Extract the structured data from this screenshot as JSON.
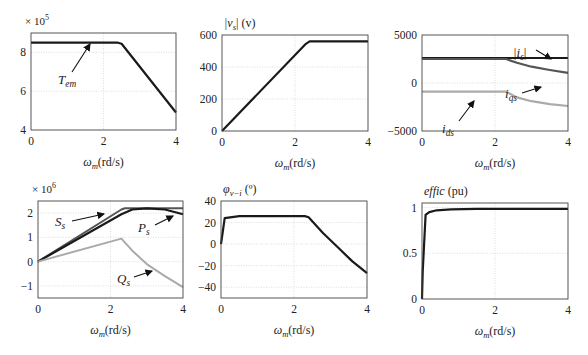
{
  "figure": {
    "xlabel_main": "ω",
    "xlabel_sub": "m",
    "xlabel_unit": "(rd/s)"
  },
  "chart_data": [
    {
      "id": "tem",
      "type": "line",
      "title": "",
      "multiplier": "× 10",
      "multiplier_exp": "5",
      "ylabel": "",
      "xlabel": "ωm(rd/s)",
      "frame": {
        "x0": 31,
        "x1": 176,
        "y0": 33,
        "y1": 130
      },
      "xlim": [
        0,
        4
      ],
      "ylim": [
        4,
        9
      ],
      "xticks": [
        0,
        2,
        4
      ],
      "yticks": [
        4,
        6,
        8
      ],
      "ytick_labels": [
        "4",
        "6",
        "8"
      ],
      "grid": true,
      "series": [
        {
          "name": "Tem",
          "color": "#1a1a1a",
          "width": 2.2,
          "x": [
            0,
            2.4,
            2.5,
            4
          ],
          "y": [
            8.5,
            8.5,
            8.45,
            4.9
          ]
        }
      ],
      "annotations": [
        {
          "text": "T",
          "sub": "em",
          "tx": 58,
          "ty": 84,
          "ax": 72,
          "ay": 72,
          "hx": 90,
          "hy": 44
        }
      ]
    },
    {
      "id": "vs",
      "type": "line",
      "title": "|vs| (v)",
      "multiplier": "",
      "multiplier_exp": "",
      "ylabel_main": "|v",
      "ylabel_sub": "s",
      "ylabel_rest": "| (v)",
      "xlabel": "ωm(rd/s)",
      "frame": {
        "x0": 222,
        "x1": 368,
        "y0": 35,
        "y1": 131
      },
      "xlim": [
        0,
        4
      ],
      "ylim": [
        0,
        600
      ],
      "xticks": [
        0,
        2,
        4
      ],
      "yticks": [
        0,
        200,
        400,
        600
      ],
      "ytick_labels": [
        "0",
        "200",
        "400",
        "600"
      ],
      "grid": true,
      "series": [
        {
          "name": "|vs|",
          "color": "#1a1a1a",
          "width": 2.2,
          "x": [
            0,
            2.3,
            2.4,
            4
          ],
          "y": [
            0,
            545,
            560,
            560
          ]
        }
      ],
      "annotations": []
    },
    {
      "id": "currents",
      "type": "line",
      "title": "",
      "multiplier": "",
      "multiplier_exp": "",
      "xlabel": "ωm(rd/s)",
      "frame": {
        "x0": 422,
        "x1": 568,
        "y0": 35,
        "y1": 131
      },
      "xlim": [
        0,
        4
      ],
      "ylim": [
        -5000,
        5000
      ],
      "xticks": [
        0,
        2,
        4
      ],
      "yticks": [
        -5000,
        0,
        5000
      ],
      "ytick_labels": [
        "−5000",
        "0",
        "5000"
      ],
      "grid": true,
      "series": [
        {
          "name": "|is|",
          "color": "#1a1a1a",
          "width": 2.2,
          "x": [
            0,
            4
          ],
          "y": [
            2600,
            2600
          ]
        },
        {
          "name": "iqs",
          "color": "#555555",
          "width": 2.2,
          "x": [
            0,
            2.3,
            2.6,
            3.0,
            3.5,
            4
          ],
          "y": [
            2500,
            2500,
            2100,
            1700,
            1350,
            1050
          ]
        },
        {
          "name": "ids",
          "color": "#aaaaaa",
          "width": 2.2,
          "x": [
            0,
            2.3,
            2.6,
            3.0,
            3.5,
            4
          ],
          "y": [
            -900,
            -900,
            -1500,
            -1900,
            -2200,
            -2400
          ]
        }
      ],
      "annotations": [
        {
          "text": "|i",
          "sub": "s",
          "tail": "|",
          "tx": 513,
          "ty": 57,
          "ax": 536,
          "ay": 50,
          "hx": 551,
          "hy": 59
        },
        {
          "text": "i",
          "sub": "qs",
          "tx": 505,
          "ty": 98,
          "ax": 522,
          "ay": 93,
          "hx": 541,
          "hy": 87
        },
        {
          "text": "i",
          "sub": "ds",
          "tx": 442,
          "ty": 133,
          "ax": 459,
          "ay": 121,
          "hx": 474,
          "hy": 101
        }
      ]
    },
    {
      "id": "power",
      "type": "line",
      "title": "",
      "multiplier": "× 10",
      "multiplier_exp": "6",
      "xlabel": "ωm(rd/s)",
      "frame": {
        "x0": 38,
        "x1": 183,
        "y0": 201,
        "y1": 298
      },
      "xlim": [
        0,
        4
      ],
      "ylim": [
        -1.5,
        2.5
      ],
      "xticks": [
        0,
        2,
        4
      ],
      "yticks": [
        -1,
        0,
        1,
        2
      ],
      "ytick_labels": [
        "−1",
        "0",
        "1",
        "2"
      ],
      "grid": true,
      "series": [
        {
          "name": "Ss",
          "color": "#555555",
          "width": 2.0,
          "x": [
            0,
            2.3,
            2.4,
            4
          ],
          "y": [
            0,
            2.15,
            2.2,
            2.2
          ]
        },
        {
          "name": "Ps",
          "color": "#1a1a1a",
          "width": 2.2,
          "x": [
            0,
            2.3,
            2.6,
            3.0,
            3.5,
            4
          ],
          "y": [
            0,
            1.95,
            2.15,
            2.2,
            2.15,
            1.95
          ]
        },
        {
          "name": "Qs",
          "color": "#aaaaaa",
          "width": 2.0,
          "x": [
            0,
            2.3,
            2.6,
            3.0,
            3.5,
            4
          ],
          "y": [
            0,
            0.95,
            0.45,
            -0.1,
            -0.6,
            -1.05
          ]
        }
      ],
      "annotations": [
        {
          "text": "S",
          "sub": "s",
          "tx": 55,
          "ty": 226,
          "ax": 72,
          "ay": 221,
          "hx": 104,
          "hy": 214
        },
        {
          "text": "P",
          "sub": "s",
          "tx": 138,
          "ty": 232,
          "ax": 155,
          "ay": 225,
          "hx": 173,
          "hy": 216
        },
        {
          "text": "Q",
          "sub": "s",
          "tx": 117,
          "ty": 283,
          "ax": 134,
          "ay": 277,
          "hx": 152,
          "hy": 271
        }
      ]
    },
    {
      "id": "phi",
      "type": "line",
      "title": "φv−i (°)",
      "ylabel_main": "φ",
      "ylabel_sub": "v−i",
      "ylabel_rest": " (º)",
      "multiplier": "",
      "multiplier_exp": "",
      "xlabel": "ωm(rd/s)",
      "frame": {
        "x0": 221,
        "x1": 367,
        "y0": 201,
        "y1": 298
      },
      "xlim": [
        0,
        4
      ],
      "ylim": [
        -50,
        40
      ],
      "xticks": [
        0,
        2,
        4
      ],
      "yticks": [
        -40,
        -20,
        0,
        20,
        40
      ],
      "ytick_labels": [
        "−40",
        "−20",
        "0",
        "20",
        "40"
      ],
      "grid": true,
      "series": [
        {
          "name": "φv−i",
          "color": "#1a1a1a",
          "width": 2.2,
          "x": [
            0,
            0.1,
            0.5,
            2.3,
            2.4,
            2.8,
            3.2,
            3.6,
            4
          ],
          "y": [
            0,
            24,
            26,
            26,
            25,
            10,
            -3,
            -16,
            -27
          ]
        }
      ],
      "annotations": []
    },
    {
      "id": "effic",
      "type": "line",
      "title": "effic (pu)",
      "ylabel_main": "effic",
      "ylabel_rest": " (pu)",
      "multiplier": "",
      "multiplier_exp": "",
      "xlabel": "ωm(rd/s)",
      "frame": {
        "x0": 422,
        "x1": 568,
        "y0": 203,
        "y1": 299
      },
      "xlim": [
        0,
        4
      ],
      "ylim": [
        0,
        1.05
      ],
      "xticks": [
        0,
        2,
        4
      ],
      "yticks": [
        0,
        0.5,
        1
      ],
      "ytick_labels": [
        "0",
        "0.5",
        "1"
      ],
      "grid": true,
      "series": [
        {
          "name": "effic",
          "color": "#1a1a1a",
          "width": 2.2,
          "x": [
            0,
            0.02,
            0.1,
            0.2,
            0.4,
            0.8,
            1.5,
            4
          ],
          "y": [
            0,
            0.3,
            0.92,
            0.95,
            0.97,
            0.98,
            0.985,
            0.985
          ]
        }
      ],
      "annotations": []
    }
  ]
}
